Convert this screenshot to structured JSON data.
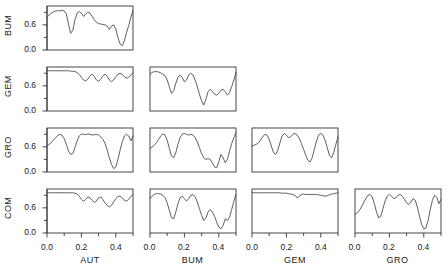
{
  "figure": {
    "kind": "scatterplot-matrix-of-coherency-plots",
    "row_labels": [
      "BUM",
      "GEM",
      "GRO",
      "COM"
    ],
    "col_labels": [
      "AUT",
      "BUM",
      "GEM",
      "GRO"
    ]
  },
  "axes": {
    "x": {
      "label_ticks": [
        "0.0",
        "0.2",
        "0.4"
      ],
      "tick_values": [
        0.0,
        0.2,
        0.4
      ],
      "minor_tick_values": [
        0.1,
        0.3,
        0.5
      ],
      "range": [
        0.0,
        0.5
      ]
    },
    "y": {
      "label_ticks": [
        "0.0",
        "0.6"
      ],
      "tick_values": [
        0.0,
        0.6
      ],
      "minor_tick_values": [
        0.3,
        0.9
      ],
      "range": [
        0.0,
        1.05
      ]
    }
  },
  "style": {
    "line_color": "#4d4d4d",
    "axis_color": "#333333",
    "background": "#ffffff",
    "line_width": 0.9
  },
  "chart_data": {
    "type": "line",
    "title": "",
    "xlabel": "frequency",
    "ylabel": "squared coherency",
    "xlim": [
      0.0,
      0.5
    ],
    "ylim": [
      0.0,
      1.05
    ],
    "grid": false,
    "legend": "none",
    "layout": "lower-triangular 4x4 matrix",
    "x": [
      0.0,
      0.0125,
      0.025,
      0.0375,
      0.05,
      0.0625,
      0.075,
      0.0875,
      0.1,
      0.1125,
      0.125,
      0.1375,
      0.15,
      0.1625,
      0.175,
      0.1875,
      0.2,
      0.2125,
      0.225,
      0.2375,
      0.25,
      0.2625,
      0.275,
      0.2875,
      0.3,
      0.3125,
      0.325,
      0.3375,
      0.35,
      0.3625,
      0.375,
      0.3875,
      0.4,
      0.4125,
      0.425,
      0.4375,
      0.45,
      0.4625,
      0.475,
      0.4875,
      0.5
    ],
    "panels": [
      {
        "row": "BUM",
        "col": "AUT",
        "grid_row": 0,
        "grid_col": 0,
        "series": [
          {
            "name": "BUM-AUT",
            "values": [
              0.78,
              0.84,
              0.88,
              0.91,
              0.93,
              0.94,
              0.93,
              0.95,
              0.93,
              0.86,
              0.62,
              0.4,
              0.47,
              0.72,
              0.88,
              0.92,
              0.88,
              0.8,
              0.86,
              0.91,
              0.88,
              0.8,
              0.72,
              0.66,
              0.63,
              0.62,
              0.61,
              0.6,
              0.57,
              0.49,
              0.57,
              0.6,
              0.5,
              0.3,
              0.14,
              0.1,
              0.22,
              0.42,
              0.58,
              0.78,
              0.95
            ]
          }
        ]
      },
      {
        "row": "GEM",
        "col": "AUT",
        "grid_row": 1,
        "grid_col": 0,
        "series": [
          {
            "name": "GEM-AUT",
            "values": [
              0.96,
              0.96,
              0.96,
              0.96,
              0.96,
              0.96,
              0.96,
              0.96,
              0.96,
              0.96,
              0.96,
              0.95,
              0.95,
              0.94,
              0.92,
              0.87,
              0.8,
              0.74,
              0.72,
              0.76,
              0.84,
              0.88,
              0.82,
              0.74,
              0.71,
              0.76,
              0.84,
              0.88,
              0.83,
              0.74,
              0.7,
              0.74,
              0.82,
              0.88,
              0.9,
              0.87,
              0.82,
              0.78,
              0.8,
              0.86,
              0.92
            ]
          }
        ]
      },
      {
        "row": "GEM",
        "col": "BUM",
        "grid_row": 1,
        "grid_col": 1,
        "series": [
          {
            "name": "GEM-BUM",
            "values": [
              0.88,
              0.92,
              0.94,
              0.94,
              0.93,
              0.91,
              0.88,
              0.84,
              0.74,
              0.58,
              0.42,
              0.48,
              0.66,
              0.8,
              0.86,
              0.8,
              0.7,
              0.74,
              0.86,
              0.9,
              0.86,
              0.74,
              0.58,
              0.4,
              0.24,
              0.14,
              0.28,
              0.46,
              0.52,
              0.47,
              0.4,
              0.38,
              0.42,
              0.5,
              0.52,
              0.46,
              0.38,
              0.44,
              0.58,
              0.74,
              0.92
            ]
          }
        ]
      },
      {
        "row": "GRO",
        "col": "AUT",
        "grid_row": 2,
        "grid_col": 0,
        "series": [
          {
            "name": "GRO-AUT",
            "values": [
              0.62,
              0.66,
              0.7,
              0.76,
              0.82,
              0.87,
              0.9,
              0.88,
              0.8,
              0.66,
              0.5,
              0.42,
              0.44,
              0.58,
              0.74,
              0.86,
              0.91,
              0.9,
              0.89,
              0.91,
              0.9,
              0.88,
              0.89,
              0.9,
              0.88,
              0.84,
              0.78,
              0.68,
              0.52,
              0.34,
              0.18,
              0.08,
              0.12,
              0.3,
              0.52,
              0.72,
              0.86,
              0.9,
              0.86,
              0.74,
              0.86
            ]
          }
        ]
      },
      {
        "row": "GRO",
        "col": "BUM",
        "grid_row": 2,
        "grid_col": 1,
        "series": [
          {
            "name": "GRO-BUM",
            "values": [
              0.56,
              0.6,
              0.64,
              0.7,
              0.78,
              0.86,
              0.91,
              0.88,
              0.76,
              0.56,
              0.38,
              0.34,
              0.46,
              0.66,
              0.82,
              0.9,
              0.92,
              0.9,
              0.88,
              0.9,
              0.88,
              0.82,
              0.72,
              0.58,
              0.44,
              0.34,
              0.3,
              0.32,
              0.3,
              0.22,
              0.12,
              0.1,
              0.24,
              0.42,
              0.34,
              0.22,
              0.3,
              0.5,
              0.68,
              0.82,
              0.94
            ]
          }
        ]
      },
      {
        "row": "GRO",
        "col": "GEM",
        "grid_row": 2,
        "grid_col": 2,
        "series": [
          {
            "name": "GRO-GEM",
            "values": [
              0.62,
              0.64,
              0.66,
              0.7,
              0.76,
              0.84,
              0.9,
              0.88,
              0.78,
              0.62,
              0.46,
              0.42,
              0.52,
              0.7,
              0.86,
              0.92,
              0.88,
              0.82,
              0.84,
              0.9,
              0.92,
              0.88,
              0.8,
              0.68,
              0.54,
              0.4,
              0.28,
              0.24,
              0.34,
              0.54,
              0.74,
              0.88,
              0.92,
              0.88,
              0.76,
              0.58,
              0.4,
              0.34,
              0.46,
              0.66,
              0.84
            ]
          }
        ]
      },
      {
        "row": "COM",
        "col": "AUT",
        "grid_row": 3,
        "grid_col": 0,
        "series": [
          {
            "name": "COM-AUT",
            "values": [
              0.96,
              0.96,
              0.96,
              0.96,
              0.96,
              0.96,
              0.96,
              0.96,
              0.96,
              0.96,
              0.96,
              0.96,
              0.96,
              0.95,
              0.93,
              0.88,
              0.8,
              0.76,
              0.8,
              0.86,
              0.84,
              0.78,
              0.73,
              0.76,
              0.84,
              0.86,
              0.8,
              0.72,
              0.66,
              0.62,
              0.66,
              0.74,
              0.82,
              0.87,
              0.88,
              0.84,
              0.78,
              0.76,
              0.8,
              0.87,
              0.93
            ]
          }
        ]
      },
      {
        "row": "COM",
        "col": "BUM",
        "grid_row": 3,
        "grid_col": 1,
        "series": [
          {
            "name": "COM-BUM",
            "values": [
              0.82,
              0.88,
              0.92,
              0.94,
              0.94,
              0.93,
              0.9,
              0.84,
              0.72,
              0.54,
              0.36,
              0.34,
              0.5,
              0.7,
              0.84,
              0.88,
              0.82,
              0.76,
              0.82,
              0.9,
              0.92,
              0.86,
              0.74,
              0.58,
              0.42,
              0.3,
              0.36,
              0.5,
              0.56,
              0.5,
              0.4,
              0.26,
              0.14,
              0.1,
              0.18,
              0.34,
              0.3,
              0.38,
              0.56,
              0.76,
              0.92
            ]
          }
        ]
      },
      {
        "row": "COM",
        "col": "GEM",
        "grid_row": 3,
        "grid_col": 2,
        "series": [
          {
            "name": "COM-GEM",
            "values": [
              0.96,
              0.96,
              0.96,
              0.96,
              0.96,
              0.96,
              0.96,
              0.96,
              0.96,
              0.96,
              0.96,
              0.96,
              0.96,
              0.96,
              0.95,
              0.95,
              0.95,
              0.94,
              0.93,
              0.92,
              0.9,
              0.84,
              0.88,
              0.92,
              0.93,
              0.92,
              0.92,
              0.92,
              0.92,
              0.92,
              0.92,
              0.91,
              0.9,
              0.89,
              0.88,
              0.89,
              0.91,
              0.93,
              0.94,
              0.95,
              0.96
            ]
          }
        ]
      },
      {
        "row": "COM",
        "col": "GRO",
        "grid_row": 3,
        "grid_col": 3,
        "series": [
          {
            "name": "COM-GRO",
            "values": [
              0.44,
              0.48,
              0.54,
              0.62,
              0.72,
              0.82,
              0.9,
              0.92,
              0.86,
              0.7,
              0.5,
              0.36,
              0.4,
              0.58,
              0.76,
              0.88,
              0.92,
              0.88,
              0.82,
              0.84,
              0.9,
              0.92,
              0.88,
              0.8,
              0.72,
              0.68,
              0.74,
              0.82,
              0.78,
              0.62,
              0.4,
              0.2,
              0.1,
              0.12,
              0.3,
              0.56,
              0.78,
              0.9,
              0.86,
              0.7,
              0.8
            ]
          }
        ]
      }
    ]
  }
}
